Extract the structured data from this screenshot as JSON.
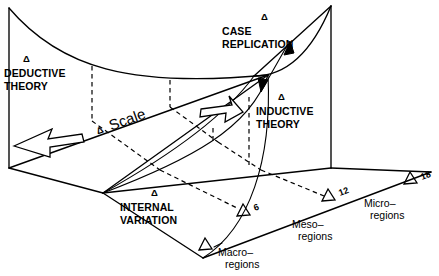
{
  "figure": {
    "background": "#ffffff",
    "ink": "#000000",
    "labels": {
      "deductive_theory": "DEDUCTIVE\nTHEORY",
      "deductive_theory_line1": "DEDUCTIVE",
      "deductive_theory_line2": "THEORY",
      "inductive_theory_line1": "INDUCTIVE",
      "inductive_theory_line2": "THEORY",
      "case_replication_line1": "CASE",
      "case_replication_line2": "REPLICATION",
      "internal_variation_line1": "INTERNAL",
      "internal_variation_line2": "VARIATION",
      "scale": "Scale",
      "delta_symbol": "Δ"
    },
    "axis": {
      "name": "Scale axis",
      "regions": [
        {
          "label_line1": "Macro–",
          "label_line2": "regions"
        },
        {
          "label_line1": "Meso–",
          "label_line2": "regions"
        },
        {
          "label_line1": "Micro–",
          "label_line2": "regions"
        }
      ],
      "ticks": [
        {
          "value": ""
        },
        {
          "value": "6"
        },
        {
          "value": "12"
        },
        {
          "value": "18"
        }
      ]
    },
    "annotations": {
      "scale_arrow_left": "decreasing-scale-arrow",
      "scale_arrow_right": "increasing-scale-arrow",
      "case_replication_arrow": "case-replication-double-arrow"
    }
  }
}
